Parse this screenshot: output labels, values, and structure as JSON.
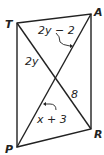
{
  "diagram": {
    "type": "parallelogram with diagonals",
    "vertices": {
      "T": "T",
      "A": "A",
      "R": "R",
      "P": "P"
    },
    "labels": {
      "top_segment": "2y − 2",
      "left_segment": "2y",
      "right_segment": "8",
      "bottom_segment": "x + 3"
    },
    "colors": {
      "stroke": "#222222",
      "background": "#ffffff"
    }
  }
}
